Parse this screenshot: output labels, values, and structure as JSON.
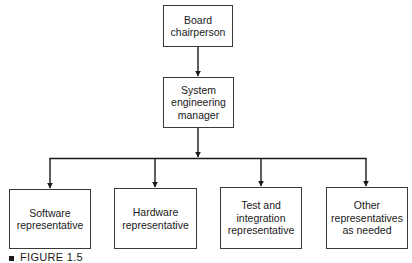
{
  "diagram": {
    "type": "organization-chart",
    "nodes": {
      "board": {
        "label": "Board\nchairperson"
      },
      "manager": {
        "label": "System\nengineering\nmanager"
      },
      "children": [
        {
          "label": "Software\nrepresentative"
        },
        {
          "label": "Hardware\nrepresentative"
        },
        {
          "label": "Test and\nintegration\nrepresentative"
        },
        {
          "label": "Other\nrepresentatives\nas needed"
        }
      ]
    },
    "edges": [
      {
        "from": "Board chairperson",
        "to": "System engineering manager"
      },
      {
        "from": "System engineering manager",
        "to": "Software representative"
      },
      {
        "from": "System engineering manager",
        "to": "Hardware representative"
      },
      {
        "from": "System engineering manager",
        "to": "Test and integration representative"
      },
      {
        "from": "System engineering manager",
        "to": "Other representatives as needed"
      }
    ]
  },
  "caption": {
    "label": "FIGURE 1.5"
  },
  "colors": {
    "line": "#1a1a1a",
    "box_border": "#3a3a3a",
    "background": "#ffffff"
  }
}
